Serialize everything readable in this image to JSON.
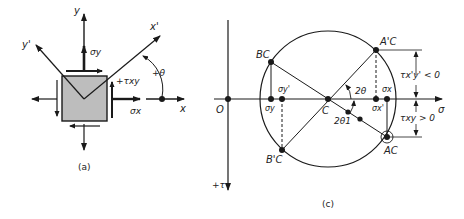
{
  "figure_a": {
    "caption": "(a)",
    "axis_x": "x",
    "axis_y": "y",
    "axis_x_prime": "x'",
    "axis_y_prime": "y'",
    "sigma_x": "σx",
    "sigma_y": "σy",
    "tau_xy": "+τxy",
    "angle": "+θ",
    "colors": {
      "element_fill": "#bdbdbd",
      "stroke": "#1a1a1a"
    }
  },
  "figure_c": {
    "caption": "(c)",
    "origin": "O",
    "center": "C",
    "sigma_axis": "σ",
    "tau_axis": "+τ",
    "points": {
      "A_C": "AC",
      "A_C_prime": "A'C",
      "B_C": "BC",
      "B_C_prime": "B'C"
    },
    "ticks": {
      "sigma_x": "σx",
      "sigma_y": "σy",
      "sigma_x_prime": "σx'",
      "sigma_y_prime": "σy'"
    },
    "angles": {
      "two_theta": "2θ",
      "two_theta_1": "2θ1"
    },
    "dimensions": {
      "tau_xpyp": "τx'y' < 0",
      "tau_xy": "τxy > 0"
    }
  }
}
